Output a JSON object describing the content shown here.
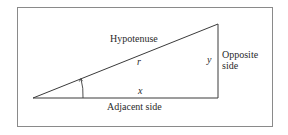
{
  "diagram": {
    "type": "right-triangle",
    "labels": {
      "hypotenuse": "Hypotenuse",
      "hypotenuse_var": "r",
      "opposite_line1": "Opposite",
      "opposite_line2": "side",
      "opposite_var": "y",
      "adjacent": "Adjacent side",
      "adjacent_var": "x"
    },
    "colors": {
      "line": "#3a3a3a",
      "frame": "#8a8a8a",
      "text": "#2a2a2a"
    }
  }
}
